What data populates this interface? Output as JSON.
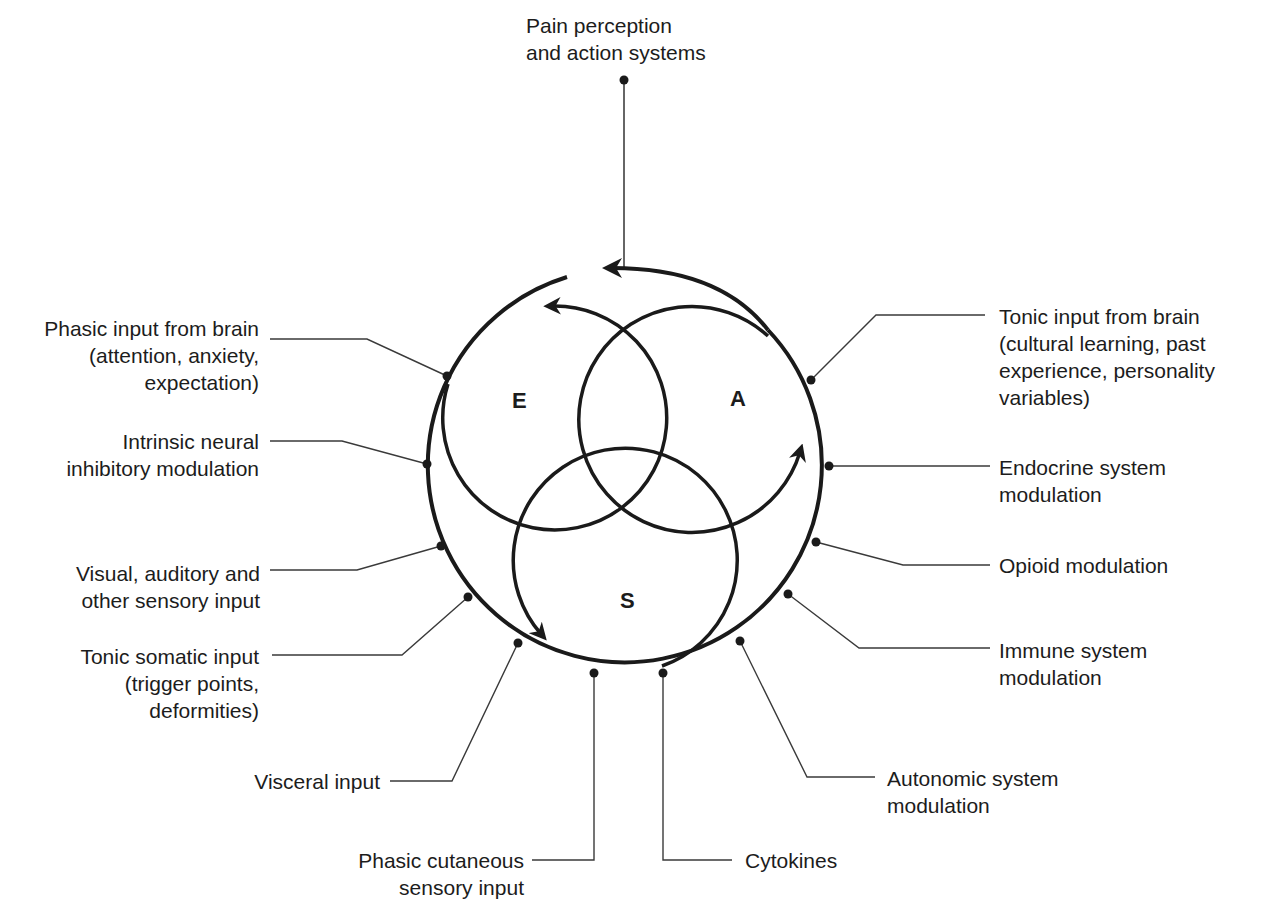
{
  "diagram": {
    "top_label": "Pain perception\nand action systems",
    "circle_letters": {
      "E": "E",
      "A": "A",
      "S": "S"
    },
    "left_labels": [
      "Phasic input from brain\n(attention, anxiety,\nexpectation)",
      "Intrinsic neural\ninhibitory modulation",
      "Visual, auditory and\nother sensory input",
      "Tonic somatic input\n(trigger points,\ndeformities)",
      "Visceral input",
      "Phasic cutaneous\nsensory input"
    ],
    "right_labels": [
      "Tonic input from brain\n(cultural learning, past\nexperience, personality\nvariables)",
      "Endocrine system\nmodulation",
      "Opioid modulation",
      "Immune system\nmodulation",
      "Autonomic system\nmodulation",
      "Cytokines"
    ],
    "colors": {
      "stroke": "#1a1a1a",
      "leader": "#3a3a3a",
      "background": "#ffffff"
    }
  }
}
